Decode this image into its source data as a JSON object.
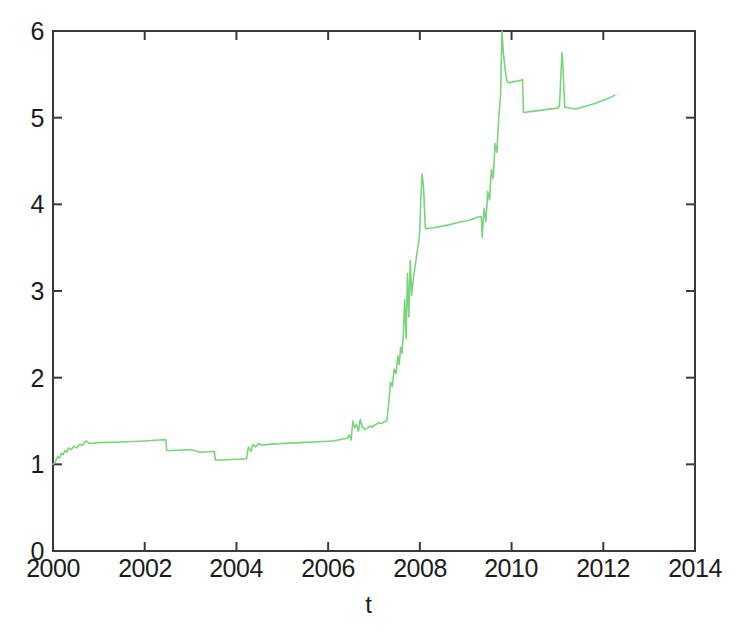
{
  "chart_data": {
    "type": "line",
    "title": "",
    "subtitle": "",
    "xlabel": "t",
    "ylabel": "",
    "xlim": [
      2000,
      2014
    ],
    "ylim": [
      0,
      6
    ],
    "xticks": [
      2000,
      2002,
      2004,
      2006,
      2008,
      2010,
      2012,
      2014
    ],
    "yticks": [
      0,
      1,
      2,
      3,
      4,
      5,
      6
    ],
    "xtick_labels": [
      "2000",
      "2002",
      "2004",
      "2006",
      "2008",
      "2010",
      "2012",
      "2014"
    ],
    "ytick_labels": [
      "0",
      "1",
      "2",
      "3",
      "4",
      "5",
      "6"
    ],
    "grid": false,
    "legend": false,
    "legend_position": "none",
    "series": [
      {
        "name": "t",
        "color": "#7ad47a",
        "line_width": 1.6,
        "marker": "none",
        "x": [
          2000.0,
          2000.05,
          2000.1,
          2000.14,
          2000.18,
          2000.22,
          2000.26,
          2000.3,
          2000.34,
          2000.4,
          2000.46,
          2000.52,
          2000.58,
          2000.64,
          2000.72,
          2000.8,
          2001.0,
          2001.3,
          2001.6,
          2002.0,
          2002.3,
          2002.46,
          2002.48,
          2002.6,
          2002.8,
          2003.0,
          2003.2,
          2003.4,
          2003.52,
          2003.54,
          2003.7,
          2003.9,
          2004.1,
          2004.22,
          2004.26,
          2004.32,
          2004.36,
          2004.42,
          2004.48,
          2004.56,
          2004.7,
          2005.0,
          2005.4,
          2005.8,
          2006.1,
          2006.3,
          2006.42,
          2006.46,
          2006.5,
          2006.54,
          2006.58,
          2006.62,
          2006.66,
          2006.7,
          2006.74,
          2006.8,
          2006.86,
          2006.92,
          2006.96,
          2007.0,
          2007.04,
          2007.1,
          2007.16,
          2007.22,
          2007.28,
          2007.32,
          2007.36,
          2007.4,
          2007.44,
          2007.48,
          2007.52,
          2007.55,
          2007.58,
          2007.61,
          2007.64,
          2007.67,
          2007.7,
          2007.73,
          2007.76,
          2007.79,
          2007.82,
          2007.86,
          2007.9,
          2007.94,
          2007.97,
          2008.0,
          2008.02,
          2008.05,
          2008.08,
          2008.12,
          2008.3,
          2008.6,
          2008.9,
          2009.1,
          2009.25,
          2009.34,
          2009.36,
          2009.4,
          2009.44,
          2009.48,
          2009.52,
          2009.56,
          2009.6,
          2009.64,
          2009.68,
          2009.72,
          2009.76,
          2009.79,
          2009.82,
          2009.86,
          2009.9,
          2009.94,
          2010.0,
          2010.1,
          2010.2,
          2010.24,
          2010.26,
          2010.4,
          2010.7,
          2011.0,
          2011.04,
          2011.06,
          2011.08,
          2011.1,
          2011.12,
          2011.14,
          2011.16,
          2011.4,
          2011.8,
          2012.1,
          2012.25
        ],
        "y": [
          1.0,
          1.03,
          1.09,
          1.07,
          1.13,
          1.11,
          1.16,
          1.14,
          1.19,
          1.17,
          1.21,
          1.19,
          1.23,
          1.22,
          1.27,
          1.24,
          1.25,
          1.255,
          1.26,
          1.27,
          1.28,
          1.285,
          1.16,
          1.16,
          1.165,
          1.17,
          1.14,
          1.145,
          1.15,
          1.05,
          1.05,
          1.055,
          1.06,
          1.065,
          1.2,
          1.15,
          1.23,
          1.2,
          1.24,
          1.22,
          1.23,
          1.24,
          1.25,
          1.26,
          1.27,
          1.29,
          1.3,
          1.34,
          1.28,
          1.5,
          1.42,
          1.46,
          1.38,
          1.52,
          1.44,
          1.4,
          1.42,
          1.44,
          1.43,
          1.45,
          1.46,
          1.48,
          1.47,
          1.49,
          1.5,
          1.7,
          1.95,
          1.9,
          2.1,
          2.05,
          2.25,
          2.15,
          2.35,
          2.28,
          2.5,
          2.9,
          2.45,
          3.2,
          2.7,
          3.35,
          2.95,
          3.15,
          3.3,
          3.45,
          3.55,
          3.7,
          4.05,
          4.35,
          4.2,
          3.72,
          3.73,
          3.76,
          3.8,
          3.82,
          3.85,
          3.86,
          3.62,
          3.95,
          3.8,
          4.15,
          4.05,
          4.4,
          4.3,
          4.7,
          4.6,
          5.0,
          5.25,
          6.0,
          5.75,
          5.55,
          5.42,
          5.4,
          5.41,
          5.42,
          5.43,
          5.44,
          5.06,
          5.07,
          5.09,
          5.11,
          5.13,
          5.3,
          5.55,
          5.75,
          5.6,
          5.35,
          5.12,
          5.1,
          5.16,
          5.22,
          5.26
        ]
      }
    ],
    "annotations": []
  },
  "axes": {
    "x_title": "t",
    "x_tick_labels": [
      "2000",
      "2002",
      "2004",
      "2006",
      "2008",
      "2010",
      "2012",
      "2014"
    ],
    "y_tick_labels": [
      "6",
      "5",
      "4",
      "3",
      "2",
      "1",
      "0"
    ]
  },
  "style": {
    "line_color": "#7ad47a",
    "frame_color": "#3a3a3a",
    "text_color": "#1c1c1c",
    "background": "#ffffff"
  }
}
